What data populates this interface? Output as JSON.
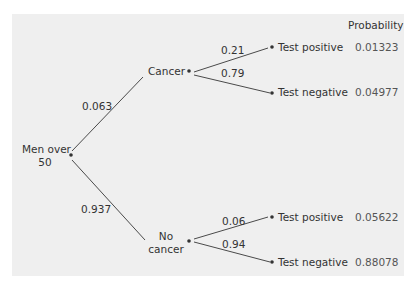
{
  "diagram": {
    "header": "Probability",
    "root": {
      "line1": "Men over",
      "line2": "50"
    },
    "branches": {
      "cancer": {
        "label": "Cancer",
        "prob": "0.063"
      },
      "no_cancer": {
        "line1": "No",
        "line2": "cancer",
        "prob": "0.937"
      }
    },
    "outcomes": [
      {
        "branch": "Cancer",
        "edge_prob": "0.21",
        "label": "Test positive",
        "joint_prob": "0.01323"
      },
      {
        "branch": "Cancer",
        "edge_prob": "0.79",
        "label": "Test negative",
        "joint_prob": "0.04977"
      },
      {
        "branch": "No cancer",
        "edge_prob": "0.06",
        "label": "Test positive",
        "joint_prob": "0.05622"
      },
      {
        "branch": "No cancer",
        "edge_prob": "0.94",
        "label": "Test negative",
        "joint_prob": "0.88078"
      }
    ],
    "colors": {
      "panel": "#efefef",
      "line": "#4a4a4a",
      "text": "#333333"
    }
  }
}
